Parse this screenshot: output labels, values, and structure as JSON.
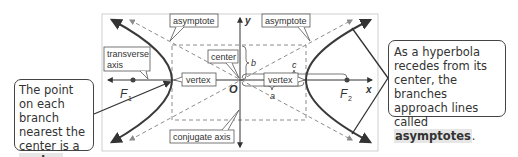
{
  "diagram": {
    "labels": {
      "asymptote_left": "asymptote",
      "asymptote_right": "asymptote",
      "transverse_axis_line1": "transverse",
      "transverse_axis_line2": "axis",
      "center": "center",
      "vertex_left": "vertex",
      "vertex_right": "vertex",
      "conjugate_axis": "conjugate axis",
      "y_axis": "y",
      "x_axis": "x",
      "origin": "O",
      "b": "b",
      "c": "c",
      "a": "a",
      "focus1": "F",
      "focus1_sub": "1",
      "focus2": "F",
      "focus2_sub": "2"
    }
  },
  "callouts": {
    "left": {
      "text_before": "The point on each branch nearest the center is a ",
      "term": "vertex",
      "text_after": "."
    },
    "right": {
      "text_before": "As a hyperbola recedes from its center, the branches approach lines called ",
      "term": "asymptotes",
      "text_after": "."
    }
  },
  "colors": {
    "curve": "#3a3a3a",
    "dashed": "#8c8c8c",
    "frame": "#cfcfcf",
    "label_border": "#555555"
  }
}
